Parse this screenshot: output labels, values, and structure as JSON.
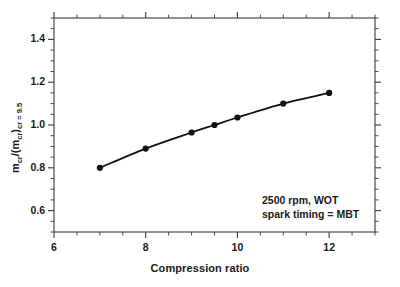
{
  "chart_data": {
    "type": "line",
    "title": "",
    "xlabel": "Compression ratio",
    "ylabel": "m_cr/(m_cr)_cr=9.5",
    "ylabel_parts": {
      "numerator": "m",
      "numerator_sub": "cr",
      "denominator_open": "/(m",
      "denominator_sub": "cr",
      "denominator_close": ")",
      "outer_sub": "cr = 9.5"
    },
    "xlim": [
      6,
      13
    ],
    "ylim": [
      0.5,
      1.5
    ],
    "x_major_ticks": [
      6,
      8,
      10,
      12
    ],
    "x_major_tick_labels": [
      "6",
      "8",
      "10",
      "12"
    ],
    "x_minor_step": 0.5,
    "y_major_ticks": [
      0.6,
      0.8,
      1.0,
      1.2,
      1.4
    ],
    "y_major_tick_labels": [
      "0.6",
      "0.8",
      "1.0",
      "1.2",
      "1.4"
    ],
    "y_minor_step": 0.05,
    "grid": false,
    "legend": "none",
    "marker": "filled-circle",
    "line_color": "#111111",
    "marker_color": "#111111",
    "axis_color": "#3a3a3a",
    "background": "#ffffff",
    "x": [
      7,
      8,
      9,
      9.5,
      10,
      11,
      12
    ],
    "values": [
      0.8,
      0.89,
      0.965,
      1.0,
      1.035,
      1.1,
      1.15
    ],
    "series": [
      {
        "name": "charge mass ratio vs compression ratio",
        "x": [
          7,
          8,
          9,
          9.5,
          10,
          11,
          12
        ],
        "values": [
          0.8,
          0.89,
          0.965,
          1.0,
          1.035,
          1.1,
          1.15
        ]
      }
    ],
    "annotations": [
      {
        "text": "2500 rpm, WOT",
        "x": 10.7,
        "y": 0.69
      },
      {
        "text": "spark timing = MBT",
        "x": 10.7,
        "y": 0.645
      }
    ]
  }
}
